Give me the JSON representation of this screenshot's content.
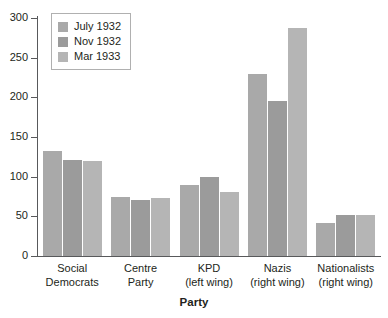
{
  "chart_data": {
    "type": "bar",
    "title": "",
    "xlabel": "Party",
    "ylabel": "",
    "ylim": [
      0,
      300
    ],
    "yticks": [
      0,
      50,
      100,
      150,
      200,
      250,
      300
    ],
    "grid": false,
    "legend_position": "top-left",
    "categories": [
      {
        "line1": "Social",
        "line2": "Democrats"
      },
      {
        "line1": "Centre",
        "line2": "Party"
      },
      {
        "line1": "KPD",
        "line2": "(left wing)"
      },
      {
        "line1": "Nazis",
        "line2": "(right wing)"
      },
      {
        "line1": "Nationalists",
        "line2": "(right wing)"
      }
    ],
    "series": [
      {
        "name": "July 1932",
        "color": "#a9a9a9",
        "values": [
          133,
          75,
          89,
          230,
          41
        ]
      },
      {
        "name": "Nov 1932",
        "color": "#9b9b9b",
        "values": [
          121,
          70,
          100,
          196,
          52
        ]
      },
      {
        "name": "Mar 1933",
        "color": "#b5b5b5",
        "values": [
          120,
          73,
          81,
          288,
          52
        ]
      }
    ]
  },
  "legend": {
    "items": [
      {
        "label": "July 1932",
        "swatch": "legend-swatch-july-1932"
      },
      {
        "label": "Nov 1932",
        "swatch": "legend-swatch-nov-1932"
      },
      {
        "label": "Mar 1933",
        "swatch": "legend-swatch-mar-1933"
      }
    ]
  },
  "axes": {
    "x_title": "Party",
    "y_tick_labels": [
      "300",
      "250",
      "200",
      "150",
      "100",
      "50",
      "0"
    ]
  }
}
